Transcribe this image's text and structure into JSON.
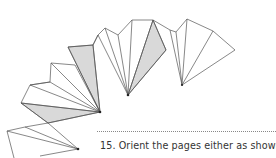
{
  "figure": {
    "fill_shaded": "#d9d9d9",
    "stroke": "#555555"
  },
  "instruction": {
    "step_number": "15.",
    "text": "Orient the pages either as shown,"
  }
}
